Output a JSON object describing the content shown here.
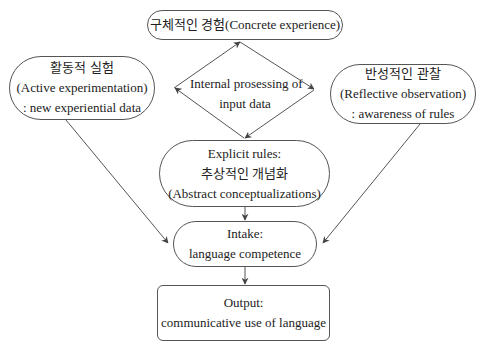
{
  "nodes": {
    "concrete": {
      "lines": [
        "구체적인 경험(Concrete experience)"
      ]
    },
    "active": {
      "lines": [
        "활동적 실험",
        "(Active experimentation)",
        ": new experiential data"
      ]
    },
    "reflective": {
      "lines": [
        "반성적인 관찰",
        "(Reflective observation)",
        ": awareness of rules"
      ]
    },
    "internal": {
      "lines": [
        "Internal prosessing of",
        "input data"
      ]
    },
    "explicit": {
      "lines": [
        "Explicit rules:",
        "추상적인 개념화",
        "(Abstract conceptualizations)"
      ]
    },
    "intake": {
      "lines": [
        "Intake:",
        "language competence"
      ]
    },
    "output": {
      "lines": [
        "Output:",
        "communicative use of language"
      ]
    }
  },
  "colors": {
    "stroke": "#555555",
    "text": "#222222",
    "background": "#ffffff"
  }
}
